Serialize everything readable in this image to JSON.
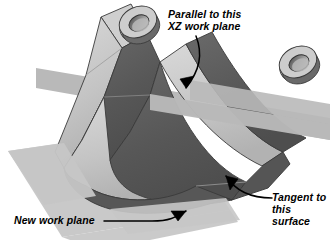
{
  "figure": {
    "background_color": "#ffffff"
  },
  "annotations": {
    "parallel": {
      "line1": "Parallel to this",
      "line2": "XZ work plane",
      "text": "Parallel to this\nXZ work plane",
      "leader": "curved-arrow-down-left",
      "target": "xz-work-plane"
    },
    "tangent": {
      "line1": "Tangent to",
      "line2": "this",
      "line3": "surface",
      "text": "Tangent to\nthis\nsurface",
      "leader": "curved-arrow-up-left",
      "target": "bracket-outer-surface"
    },
    "new_plane": {
      "line1": "New work plane",
      "text": "New work plane",
      "leader": "straight-then-curved-arrow-right",
      "target": "new-work-plane"
    }
  },
  "colors": {
    "face_light": "#c9c9c9",
    "face_light_top": "#d6d6d6",
    "face_dark": "#5d5d5d",
    "face_mid": "#8f8f8f",
    "plane_xz": "#b9b9b9",
    "plane_new": "#c6c6c6",
    "outline": "#3a3a3a",
    "text": "#000000",
    "background": "#ffffff"
  },
  "geometry": {
    "part_name": "u-shaped-bracket",
    "features": [
      "left-arm",
      "right-arm",
      "u-bend",
      "left-hole",
      "right-hole"
    ],
    "planes": [
      "xz-work-plane",
      "new-work-plane"
    ]
  }
}
